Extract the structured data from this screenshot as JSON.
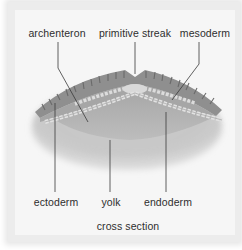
{
  "diagram": {
    "caption": "cross section",
    "labels": {
      "archenteron": "archenteron",
      "primitive_streak": "primitive streak",
      "mesoderm": "mesoderm",
      "ectoderm": "ectoderm",
      "yolk": "yolk",
      "endoderm": "endoderm"
    },
    "colors": {
      "frame": "#ececec",
      "panel": "#f6f6f6",
      "leader_line": "#3a3a3a",
      "tissue_dark": "#8a8a8a",
      "tissue_mid": "#b5b5b5",
      "yolk": "#cfcfcf",
      "cells": "#e9e9e9"
    }
  }
}
